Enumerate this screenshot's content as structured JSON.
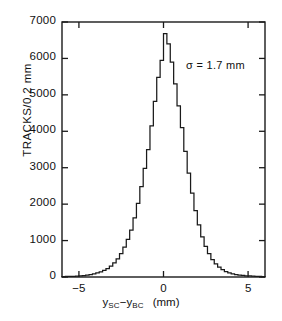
{
  "chart_data": {
    "type": "line",
    "subtype": "step-histogram",
    "title": "",
    "xlabel": "y_SC - y_BC  (mm)",
    "ylabel": "TRACKS/0.2 mm",
    "xlabel_parts": {
      "y1": "y",
      "sub1": "SC",
      "minus": "−",
      "y2": "y",
      "sub2": "BC",
      "units": "(mm)"
    },
    "annotation": "σ = 1.7 mm",
    "annotation_sigma_mm": 1.7,
    "bin_width_mm": 0.2,
    "grid": false,
    "legend": null,
    "xlim": [
      -6,
      6
    ],
    "ylim": [
      0,
      7000
    ],
    "xticks": [
      -5,
      0,
      5
    ],
    "xtick_labels": [
      "−5",
      "0",
      "5"
    ],
    "yticks": [
      0,
      1000,
      2000,
      3000,
      4000,
      5000,
      6000,
      7000
    ],
    "ytick_labels": [
      "0",
      "1000",
      "2000",
      "3000",
      "4000",
      "5000",
      "6000",
      "7000"
    ],
    "peak_value": 6680,
    "peak_x_mm": 0.0,
    "x": [
      -6.0,
      -5.8,
      -5.6,
      -5.4,
      -5.2,
      -5.0,
      -4.8,
      -4.6,
      -4.4,
      -4.2,
      -4.0,
      -3.8,
      -3.6,
      -3.4,
      -3.2,
      -3.0,
      -2.8,
      -2.6,
      -2.4,
      -2.2,
      -2.0,
      -1.8,
      -1.6,
      -1.4,
      -1.2,
      -1.0,
      -0.8,
      -0.6,
      -0.4,
      -0.2,
      0.0,
      0.2,
      0.4,
      0.6,
      0.8,
      1.0,
      1.2,
      1.4,
      1.6,
      1.8,
      2.0,
      2.2,
      2.4,
      2.6,
      2.8,
      3.0,
      3.2,
      3.4,
      3.6,
      3.8,
      4.0,
      4.2,
      4.4,
      4.6,
      4.8,
      5.0,
      5.2,
      5.4,
      5.6,
      5.8
    ],
    "values": [
      12,
      14,
      16,
      20,
      24,
      30,
      40,
      52,
      68,
      86,
      110,
      140,
      180,
      230,
      300,
      390,
      500,
      640,
      820,
      1030,
      1290,
      1620,
      2020,
      2480,
      2980,
      3500,
      4150,
      4820,
      5480,
      5950,
      6680,
      6400,
      5900,
      5300,
      4700,
      4100,
      3450,
      2850,
      2300,
      1820,
      1430,
      1100,
      840,
      640,
      480,
      360,
      270,
      200,
      150,
      115,
      88,
      68,
      52,
      42,
      34,
      28,
      22,
      18,
      15,
      12
    ]
  },
  "axis": {
    "frame_color": "#1a1a1a",
    "curve_color": "#1a1a1a"
  }
}
